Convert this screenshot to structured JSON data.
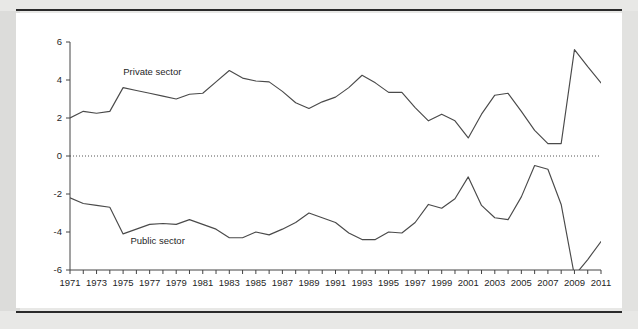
{
  "figure": {
    "background_color": "#e8e8e6",
    "card_color": "#ffffff",
    "line_color": "#4a4a4a",
    "axis_color": "#444444",
    "private_label": "Private sector",
    "public_label": "Public sector"
  },
  "chart_data": {
    "type": "line",
    "title": "",
    "subtitle": "",
    "xlabel": "",
    "ylabel": "",
    "grid": false,
    "legend": "inline-annotations",
    "zero_line": true,
    "xlim": [
      1971,
      2011
    ],
    "ylim": [
      -6,
      6
    ],
    "yticks": [
      -6,
      -4,
      -2,
      0,
      2,
      4,
      6
    ],
    "ytick_labels": [
      "-6",
      "-4",
      "-2",
      "0",
      "2",
      "4",
      "6"
    ],
    "xticks": [
      1971,
      1972,
      1973,
      1974,
      1975,
      1976,
      1977,
      1978,
      1979,
      1980,
      1981,
      1982,
      1983,
      1984,
      1985,
      1986,
      1987,
      1988,
      1989,
      1990,
      1991,
      1992,
      1993,
      1994,
      1995,
      1996,
      1997,
      1998,
      1999,
      2000,
      2001,
      2002,
      2003,
      2004,
      2005,
      2006,
      2007,
      2008,
      2009,
      2010,
      2011
    ],
    "xtick_labels": [
      "1971",
      "",
      "1973",
      "",
      "1975",
      "",
      "1977",
      "",
      "1979",
      "",
      "1981",
      "",
      "1983",
      "",
      "1985",
      "",
      "1987",
      "",
      "1989",
      "",
      "1991",
      "",
      "1993",
      "",
      "1995",
      "",
      "1997",
      "",
      "1999",
      "",
      "2001",
      "",
      "2003",
      "",
      "2005",
      "",
      "2007",
      "",
      "2009",
      "",
      "2011"
    ],
    "x": [
      1971,
      1972,
      1973,
      1974,
      1975,
      1976,
      1977,
      1978,
      1979,
      1980,
      1981,
      1982,
      1983,
      1984,
      1985,
      1986,
      1987,
      1988,
      1989,
      1990,
      1991,
      1992,
      1993,
      1994,
      1995,
      1996,
      1997,
      1998,
      1999,
      2000,
      2001,
      2002,
      2003,
      2004,
      2005,
      2006,
      2007,
      2008,
      2009,
      2010,
      2011
    ],
    "series": [
      {
        "name": "Private sector",
        "label_x": 1977.2,
        "label_y": 4.25,
        "values": [
          2.0,
          2.35,
          2.25,
          2.35,
          3.6,
          3.45,
          3.3,
          3.15,
          3.0,
          3.25,
          3.3,
          3.9,
          4.5,
          4.1,
          3.95,
          3.9,
          3.4,
          2.8,
          2.5,
          2.85,
          3.1,
          3.6,
          4.25,
          3.85,
          3.35,
          3.35,
          2.55,
          1.85,
          2.2,
          1.85,
          0.95,
          2.2,
          3.2,
          3.3,
          2.35,
          1.35,
          0.65,
          0.65,
          5.6,
          4.7,
          3.85
        ]
      },
      {
        "name": "Public sector",
        "label_x": 1977.6,
        "label_y": -4.65,
        "values": [
          -2.2,
          -2.5,
          -2.6,
          -2.7,
          -4.1,
          -3.85,
          -3.6,
          -3.55,
          -3.6,
          -3.35,
          -3.6,
          -3.85,
          -4.3,
          -4.3,
          -4.0,
          -4.15,
          -3.85,
          -3.5,
          -3.0,
          -3.25,
          -3.5,
          -4.05,
          -4.4,
          -4.4,
          -4.0,
          -4.05,
          -3.5,
          -2.55,
          -2.75,
          -2.25,
          -1.1,
          -2.6,
          -3.25,
          -3.35,
          -2.15,
          -0.5,
          -0.7,
          -2.55,
          -6.3,
          -5.45,
          -4.5
        ]
      }
    ]
  }
}
